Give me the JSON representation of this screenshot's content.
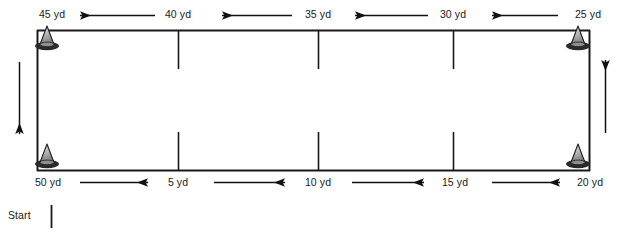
{
  "diagram": {
    "type": "drill-course-diagram",
    "stroke_color": "#1a1a1a",
    "cone_body_color": "#9a9a9a",
    "cone_base_color": "#2b2b2b",
    "background_color": "#ffffff",
    "start": {
      "label": "Start",
      "x": 22,
      "y": 214
    },
    "top_labels": [
      {
        "text": "45 yd",
        "x": 52,
        "y": 14
      },
      {
        "text": "40 yd",
        "x": 178,
        "y": 14
      },
      {
        "text": "35 yd",
        "x": 318,
        "y": 14
      },
      {
        "text": "30 yd",
        "x": 453,
        "y": 14
      },
      {
        "text": "25 yd",
        "x": 588,
        "y": 14
      }
    ],
    "bottom_labels": [
      {
        "text": "50 yd",
        "x": 48,
        "y": 182
      },
      {
        "text": "5 yd",
        "x": 178,
        "y": 182
      },
      {
        "text": "10 yd",
        "x": 318,
        "y": 182
      },
      {
        "text": "15 yd",
        "x": 455,
        "y": 182
      },
      {
        "text": "20 yd",
        "x": 590,
        "y": 182
      }
    ],
    "top_arrows": [
      {
        "name": "arrow-45-to-40",
        "direction": "left",
        "x1": 155,
        "x2": 80,
        "y": 15
      },
      {
        "name": "arrow-40-to-35",
        "direction": "left",
        "x1": 292,
        "x2": 222,
        "y": 15
      },
      {
        "name": "arrow-35-to-30",
        "direction": "left",
        "x1": 428,
        "x2": 355,
        "y": 15
      },
      {
        "name": "arrow-30-to-25",
        "direction": "left",
        "x1": 558,
        "x2": 492,
        "y": 15
      }
    ],
    "bottom_arrows": [
      {
        "name": "arrow-50-to-5",
        "direction": "right",
        "x1": 80,
        "x2": 148,
        "y": 182
      },
      {
        "name": "arrow-5-to-10",
        "direction": "right",
        "x1": 214,
        "x2": 285,
        "y": 182
      },
      {
        "name": "arrow-10-to-15",
        "direction": "right",
        "x1": 352,
        "x2": 424,
        "y": 182
      },
      {
        "name": "arrow-15-to-20",
        "direction": "right",
        "x1": 492,
        "x2": 560,
        "y": 182
      }
    ],
    "side_arrows": [
      {
        "name": "arrow-down-left-side",
        "direction": "down",
        "x": 19,
        "y1": 62,
        "y2": 134
      },
      {
        "name": "arrow-up-right-side",
        "direction": "up",
        "x": 605,
        "y1": 133,
        "y2": 60
      }
    ],
    "cones": [
      {
        "name": "cone-top-left",
        "x": 47,
        "y": 38
      },
      {
        "name": "cone-top-right",
        "x": 578,
        "y": 38
      },
      {
        "name": "cone-bottom-left",
        "x": 47,
        "y": 155
      },
      {
        "name": "cone-bottom-right",
        "x": 578,
        "y": 155
      }
    ],
    "rect": {
      "left": 37,
      "top": 30,
      "right": 590,
      "bottom": 170
    },
    "top_ticks_x": [
      178,
      318,
      453
    ],
    "bottom_ticks_x": [
      178,
      318,
      453
    ],
    "tick_length": 38
  }
}
